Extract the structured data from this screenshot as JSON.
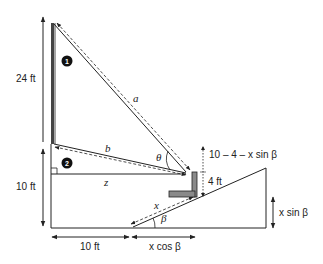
{
  "diagram": {
    "labels": {
      "height_top": "24 ft",
      "height_bottom": "10 ft",
      "base_left": "10 ft",
      "base_right": "x cos β",
      "right_height": "x sin β",
      "bracket_height": "4 ft",
      "gap_expr": "10 – 4 – x sin β",
      "line_a": "a",
      "line_b": "b",
      "line_z": "z",
      "line_x": "x",
      "angle_theta": "θ",
      "angle_beta": "β"
    },
    "markers": [
      {
        "id": "1",
        "label": "1"
      },
      {
        "id": "2",
        "label": "2"
      }
    ],
    "colors": {
      "line": "#222222",
      "pole_fill": "#555555",
      "bracket_fill": "#8a8a8a",
      "badge": "#111111"
    }
  }
}
